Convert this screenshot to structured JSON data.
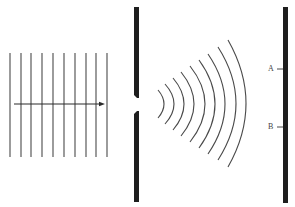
{
  "diagram": {
    "colors": {
      "background": "#ffffff",
      "wavefront": "#4a4a4a",
      "barrier": "#1e1e1e",
      "arrow": "#2a2a2a",
      "label": "#444444"
    },
    "incident_waves": {
      "count": 10,
      "x_positions": [
        10,
        21,
        31,
        42,
        53,
        64,
        75,
        86,
        96,
        107
      ],
      "y_top": 53,
      "y_bottom": 157,
      "direction_arrow": {
        "x_start": 14,
        "x_end": 105,
        "y": 104
      }
    },
    "slit_barrier": {
      "x_left": 134,
      "x_right": 139,
      "y_top": 7,
      "y_bottom": 202,
      "gap_top": 98,
      "gap_bottom": 111
    },
    "diffracted_waves": {
      "count": 9,
      "arcs": [
        {
          "x_apex": 164,
          "x_ends": 158,
          "y_top": 90,
          "y_bottom": 118
        },
        {
          "x_apex": 174,
          "x_ends": 165,
          "y_top": 84,
          "y_bottom": 124
        },
        {
          "x_apex": 184,
          "x_ends": 173,
          "y_top": 78,
          "y_bottom": 130
        },
        {
          "x_apex": 194,
          "x_ends": 181,
          "y_top": 72,
          "y_bottom": 136
        },
        {
          "x_apex": 205,
          "x_ends": 190,
          "y_top": 66,
          "y_bottom": 142
        },
        {
          "x_apex": 215,
          "x_ends": 199,
          "y_top": 60,
          "y_bottom": 148
        },
        {
          "x_apex": 225,
          "x_ends": 208,
          "y_top": 54,
          "y_bottom": 154
        },
        {
          "x_apex": 236,
          "x_ends": 218,
          "y_top": 47,
          "y_bottom": 160
        },
        {
          "x_apex": 246,
          "x_ends": 228,
          "y_top": 40,
          "y_bottom": 167
        }
      ]
    },
    "screen": {
      "x_left": 283,
      "x_right": 288,
      "y_top": 7,
      "y_bottom": 203
    },
    "points": [
      {
        "label": "A",
        "y": 69,
        "label_x": 268
      },
      {
        "label": "B",
        "y": 127,
        "label_x": 268
      }
    ]
  }
}
